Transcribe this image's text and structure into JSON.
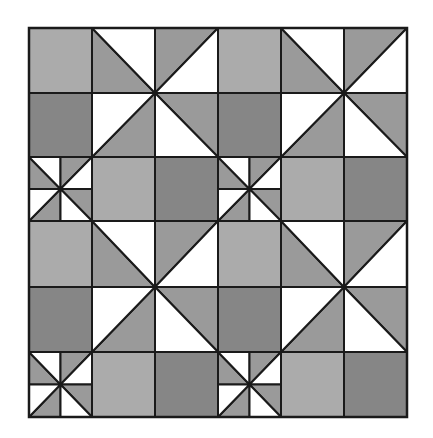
{
  "diagram": {
    "grid": {
      "columns": 6,
      "rows": 6
    },
    "repeat": {
      "block_size": 3,
      "tiles_x": 2,
      "tiles_y": 2
    },
    "colors": {
      "light": "#ababab",
      "dark": "#868686",
      "triangle": "#9a9a9a",
      "white": "#ffffff",
      "line": "#1a1a1a",
      "background": "#ffffff"
    },
    "block": [
      [
        "light-square",
        "pinwheel-tl",
        "pinwheel-tr"
      ],
      [
        "dark-square",
        "pinwheel-bl",
        "pinwheel-br"
      ],
      [
        "small-pinwheel",
        "light-square",
        "dark-square"
      ]
    ]
  }
}
